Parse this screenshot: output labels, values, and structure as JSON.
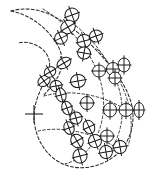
{
  "figure": {
    "title": "Crescent-shaped region with distributed crossed-ellipse markers",
    "background_color": "#ffffff",
    "ink_color": "#1c1c1c",
    "width": 152,
    "height": 176
  },
  "crosshair": {
    "label": "+",
    "center_x": 34,
    "center_y": 114,
    "arm_length": 9,
    "color": "#2a2a2a"
  },
  "outline": {
    "name": "region-outline",
    "stroke_color": "#2b2b2b",
    "dash_pattern": "3 2.1",
    "path": "M 11 11 C 24 7, 41 9, 55 17 C 72 26, 86 39, 99 53 C 112 67, 124 82, 130 99 C 136 116, 133 135, 122 149 C 110 163, 91 170, 73 167 C 56 164, 44 152, 38 137 C 33 124, 33 111, 37 99 C 41 87, 47 78, 49 70 C 51 61, 48 54, 42 49 C 35 43, 25 41, 18 43"
  },
  "inner_edge": {
    "name": "region-inner-edge",
    "path": "M 11 11 C 27 14, 42 24, 52 37 C 61 48, 64 59, 61 69 C 58 80, 50 88, 44 95"
  },
  "ribs": [
    {
      "name": "rib-1",
      "path": "M 43 9 C 58 18, 72 31, 83 46 C 94 61, 101 77, 103 94 C 105 111, 102 129, 93 143 C 86 154, 76 161, 65 164"
    },
    {
      "name": "rib-2",
      "path": "M 68 20 C 84 31, 98 46, 108 63 C 118 80, 123 98, 122 116 C 121 132, 115 146, 105 156"
    },
    {
      "name": "rib-3",
      "path": "M 97 49 C 110 63, 120 79, 126 96 C 132 113, 133 131, 128 146"
    },
    {
      "name": "rib-cross-a",
      "path": "M 44 96 C 58 92, 74 92, 89 95 C 104 98, 118 104, 129 112"
    },
    {
      "name": "rib-cross-b",
      "path": "M 38 131 C 52 128, 68 129, 83 133 C 98 137, 112 144, 122 152"
    }
  ],
  "markers": {
    "description": "Crossed ellipse / crossed circle symbols distributed across the region",
    "count": 30,
    "fill_color": "#ffffff",
    "stroke_color": "#1c1c1c",
    "items": [
      {
        "id": "m01",
        "cx": 72,
        "cy": 15,
        "rx": 7.0,
        "ry": 7.0,
        "rot": -20
      },
      {
        "id": "m02",
        "cx": 68,
        "cy": 27,
        "rx": 7.5,
        "ry": 6.5,
        "rot": -30
      },
      {
        "id": "m03",
        "cx": 61,
        "cy": 38,
        "rx": 6.5,
        "ry": 6.0,
        "rot": -25
      },
      {
        "id": "m04",
        "cx": 84,
        "cy": 41,
        "rx": 7.0,
        "ry": 6.5,
        "rot": -15
      },
      {
        "id": "m05",
        "cx": 96,
        "cy": 36,
        "rx": 6.5,
        "ry": 6.0,
        "rot": -20
      },
      {
        "id": "m06",
        "cx": 84,
        "cy": 53,
        "rx": 6.5,
        "ry": 6.0,
        "rot": 10
      },
      {
        "id": "m07",
        "cx": 64,
        "cy": 63,
        "rx": 7.5,
        "ry": 5.0,
        "rot": -30
      },
      {
        "id": "m08",
        "cx": 78,
        "cy": 81,
        "rx": 7.5,
        "ry": 6.5,
        "rot": -10
      },
      {
        "id": "m09",
        "cx": 99,
        "cy": 71,
        "rx": 6.5,
        "ry": 6.0,
        "rot": 0
      },
      {
        "id": "m10",
        "cx": 113,
        "cy": 69,
        "rx": 6.5,
        "ry": 6.5,
        "rot": 0
      },
      {
        "id": "m11",
        "cx": 124,
        "cy": 65,
        "rx": 6.0,
        "ry": 7.0,
        "rot": 0
      },
      {
        "id": "m12",
        "cx": 115,
        "cy": 78,
        "rx": 6.0,
        "ry": 6.0,
        "rot": 0
      },
      {
        "id": "m13",
        "cx": 44,
        "cy": 81,
        "rx": 6.5,
        "ry": 5.0,
        "rot": -35
      },
      {
        "id": "m14",
        "cx": 56,
        "cy": 86,
        "rx": 6.0,
        "ry": 5.5,
        "rot": -10
      },
      {
        "id": "m15",
        "cx": 61,
        "cy": 95,
        "rx": 5.0,
        "ry": 7.0,
        "rot": -15
      },
      {
        "id": "m16",
        "cx": 67,
        "cy": 108,
        "rx": 5.0,
        "ry": 7.0,
        "rot": -20
      },
      {
        "id": "m17",
        "cx": 87,
        "cy": 103,
        "rx": 6.5,
        "ry": 6.5,
        "rot": 0
      },
      {
        "id": "m18",
        "cx": 110,
        "cy": 110,
        "rx": 6.5,
        "ry": 7.0,
        "rot": 0
      },
      {
        "id": "m19",
        "cx": 126,
        "cy": 110,
        "rx": 7.0,
        "ry": 6.5,
        "rot": 0
      },
      {
        "id": "m20",
        "cx": 139,
        "cy": 110,
        "rx": 5.0,
        "ry": 7.5,
        "rot": 0
      },
      {
        "id": "m21",
        "cx": 76,
        "cy": 118,
        "rx": 6.0,
        "ry": 6.0,
        "rot": -15
      },
      {
        "id": "m22",
        "cx": 69,
        "cy": 128,
        "rx": 5.0,
        "ry": 6.5,
        "rot": -20
      },
      {
        "id": "m23",
        "cx": 89,
        "cy": 127,
        "rx": 5.5,
        "ry": 7.0,
        "rot": -25
      },
      {
        "id": "m24",
        "cx": 77,
        "cy": 141,
        "rx": 6.0,
        "ry": 7.0,
        "rot": -30
      },
      {
        "id": "m25",
        "cx": 95,
        "cy": 141,
        "rx": 6.5,
        "ry": 6.5,
        "rot": -20
      },
      {
        "id": "m26",
        "cx": 107,
        "cy": 136,
        "rx": 6.5,
        "ry": 6.0,
        "rot": 0
      },
      {
        "id": "m27",
        "cx": 80,
        "cy": 156,
        "rx": 7.0,
        "ry": 7.0,
        "rot": -15
      },
      {
        "id": "m28",
        "cx": 106,
        "cy": 152,
        "rx": 6.5,
        "ry": 6.5,
        "rot": -10
      },
      {
        "id": "m29",
        "cx": 120,
        "cy": 147,
        "rx": 6.5,
        "ry": 6.5,
        "rot": -10
      },
      {
        "id": "m30",
        "cx": 50,
        "cy": 72,
        "rx": 6.0,
        "ry": 5.0,
        "rot": -30
      }
    ]
  }
}
